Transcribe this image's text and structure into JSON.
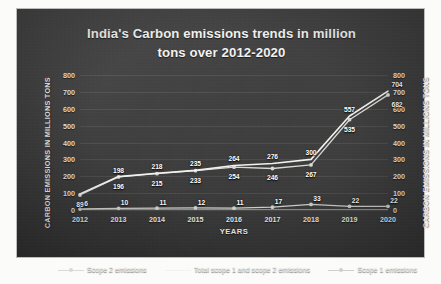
{
  "chart_data": {
    "type": "line",
    "title": "India's Carbon emissions trends in million tons over 2012-2020",
    "title_line1": "India's Carbon emissions trends in million",
    "title_line2": "tons over 2012-2020",
    "xlabel": "YEARS",
    "ylabel": "CARBON EMISSIONS IN MILLIONS TONS",
    "ylabel_right": "CARBON EMISSIONS IN MILLIONS TONS",
    "categories": [
      "2012",
      "2013",
      "2014",
      "2015",
      "2016",
      "2017",
      "2018",
      "2019",
      "2020"
    ],
    "x": [
      2012,
      2013,
      2014,
      2015,
      2016,
      2017,
      2018,
      2019,
      2020
    ],
    "ylim": [
      0,
      800
    ],
    "yticks": [
      0,
      100,
      200,
      300,
      400,
      500,
      600,
      700,
      800
    ],
    "grid": true,
    "legend_position": "bottom",
    "series": [
      {
        "name": "Scope 2 emissions",
        "color": "#d9d9d6",
        "marker": "circle",
        "values": [
          89,
          196,
          215,
          233,
          254,
          246,
          267,
          535,
          682
        ],
        "labels": [
          "89",
          "196",
          "215",
          "233",
          "254",
          "246",
          "267",
          "535",
          "682"
        ]
      },
      {
        "name": "Total scope 1 and scope 2 emissions",
        "color": "#f2f2ef",
        "marker": "none",
        "values": [
          95,
          198,
          218,
          235,
          264,
          276,
          300,
          557,
          704
        ],
        "labels": [
          "",
          "198",
          "218",
          "235",
          "264",
          "276",
          "300",
          "557",
          "704"
        ]
      },
      {
        "name": "Scope 1 emissions",
        "color": "#cfcfcb",
        "marker": "circle",
        "values": [
          6,
          10,
          11,
          12,
          11,
          17,
          33,
          22,
          22
        ],
        "labels": [
          "6",
          "10",
          "11",
          "12",
          "11",
          "17",
          "33",
          "22",
          "22"
        ]
      }
    ]
  },
  "legend": {
    "items": [
      {
        "label": "Scope 2 emissions"
      },
      {
        "label": "Total scope 1 and scope 2 emissions"
      },
      {
        "label": "Scope 1 emissions"
      }
    ]
  },
  "colors": {
    "panel_background": "#3a3a3a",
    "text": "#f2f2f0",
    "grid": "rgba(255,255,255,0.085)",
    "series_scope2": "#d9d9d6",
    "series_total": "#f2f2ef",
    "series_scope1": "#cfcfcb"
  }
}
